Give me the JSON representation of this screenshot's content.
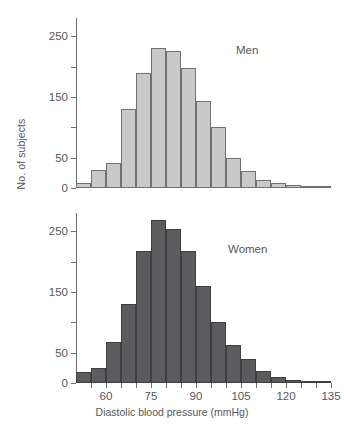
{
  "figure": {
    "ylabel": "No. of subjects",
    "xlabel": "Diastolic blood pressure (mmHg)",
    "caption_fragment": ""
  },
  "panels": [
    {
      "id": "men",
      "label": "Men",
      "color": "#c9c9c9",
      "border": "#717173"
    },
    {
      "id": "women",
      "label": "Women",
      "color": "#5c5c5e",
      "border": "#3f3f41"
    }
  ],
  "axis": {
    "y_labels": [
      "250",
      "150",
      "50",
      "0"
    ],
    "y_label_values": [
      250,
      150,
      50,
      0
    ],
    "y_minor_ticks": [
      200,
      100
    ],
    "y_max": 280,
    "x_labels": [
      "60",
      "75",
      "90",
      "105",
      "120",
      "135"
    ],
    "x_label_values": [
      60,
      75,
      90,
      105,
      120,
      135
    ],
    "x_ticks": [
      55,
      60,
      65,
      70,
      75,
      80,
      85,
      90,
      95,
      100,
      105,
      110,
      115,
      120,
      125,
      130,
      135
    ],
    "x_min": 50,
    "x_max": 135
  },
  "chart_data": {
    "type": "bar",
    "title": "",
    "subtitle": "",
    "xlabel": "Diastolic blood pressure (mmHg)",
    "ylabel": "No. of subjects",
    "xlim": [
      50,
      135
    ],
    "ylim": [
      0,
      280
    ],
    "grid": false,
    "legend_position": "inside-right",
    "bin_width": 5,
    "bin_starts": [
      50,
      55,
      60,
      65,
      70,
      75,
      80,
      85,
      90,
      95,
      100,
      105,
      110,
      115,
      120,
      125,
      130
    ],
    "categories": [
      "50-55",
      "55-60",
      "60-65",
      "65-70",
      "70-75",
      "75-80",
      "80-85",
      "85-90",
      "90-95",
      "95-100",
      "100-105",
      "105-110",
      "110-115",
      "115-120",
      "120-125",
      "125-130",
      "130-135"
    ],
    "series": [
      {
        "name": "Men",
        "color": "#c9c9c9",
        "values": [
          8,
          30,
          42,
          130,
          190,
          230,
          225,
          197,
          143,
          100,
          50,
          28,
          14,
          9,
          5,
          2,
          1
        ]
      },
      {
        "name": "Women",
        "color": "#5c5c5e",
        "values": [
          18,
          25,
          68,
          130,
          217,
          268,
          253,
          217,
          160,
          100,
          62,
          40,
          20,
          10,
          5,
          2,
          1
        ]
      }
    ],
    "annotations": [
      {
        "text": "Men",
        "panel": "men"
      },
      {
        "text": "Women",
        "panel": "women"
      }
    ]
  }
}
